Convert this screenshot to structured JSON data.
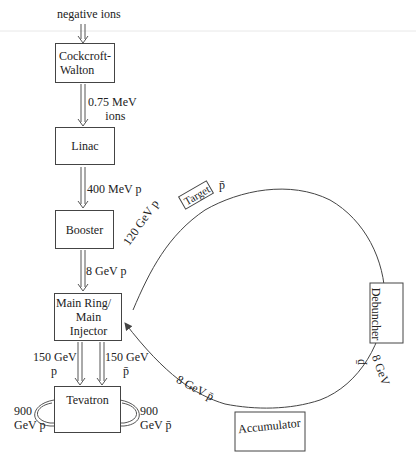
{
  "source_label": "negative ions",
  "boxes": {
    "cockcroft": {
      "line1": "Cockcroft-",
      "line2": "Walton"
    },
    "linac": "Linac",
    "booster": "Booster",
    "main_ring": {
      "line1": "Main Ring/",
      "line2": "Main Injector"
    },
    "tevatron": "Tevatron",
    "target": "Target",
    "debuncher": "Debuncher",
    "accumulator": "Accumulator"
  },
  "transfers": {
    "cw_to_linac": {
      "line1": "0.75 MeV",
      "line2": "ions"
    },
    "linac_to_booster": "400 MeV p",
    "booster_to_main": "8 GeV p",
    "main_to_tev_p": {
      "line1": "150 GeV",
      "line2": "p"
    },
    "main_to_tev_pbar": {
      "line1": "150 GeV",
      "line2": "p̄"
    },
    "tev_p": {
      "line1": "900",
      "line2": "GeV p"
    },
    "tev_pbar": {
      "line1": "900",
      "line2": "GeV p̄"
    },
    "main_to_target": "120 GeV p",
    "target_out": "p̄",
    "debuncher_out": {
      "energy": "8 GeV",
      "particle": "p̄"
    },
    "accumulator_to_main": "8 GeV p̄"
  },
  "colors": {
    "line": "#444444",
    "text": "#222222",
    "rule": "#e6e6e6"
  }
}
